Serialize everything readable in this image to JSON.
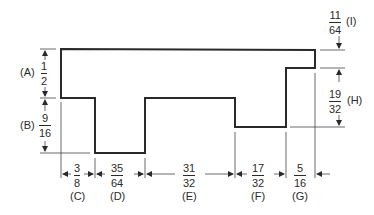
{
  "diagram": {
    "type": "dimensioned stepped profile",
    "stroke_color": "#2a2a2a",
    "labels": {
      "A": {
        "tag": "(A)",
        "num": "1",
        "den": "2"
      },
      "B": {
        "tag": "(B)",
        "num": "9",
        "den": "16"
      },
      "C": {
        "tag": "(C)",
        "num": "3",
        "den": "8"
      },
      "D": {
        "tag": "(D)",
        "num": "35",
        "den": "64"
      },
      "E": {
        "tag": "(E)",
        "num": "31",
        "den": "32"
      },
      "F": {
        "tag": "(F)",
        "num": "17",
        "den": "32"
      },
      "G": {
        "tag": "(G)",
        "num": "5",
        "den": "16"
      },
      "H": {
        "tag": "(H)",
        "num": "19",
        "den": "32"
      },
      "I": {
        "tag": "(I)",
        "num": "11",
        "den": "64"
      }
    }
  }
}
